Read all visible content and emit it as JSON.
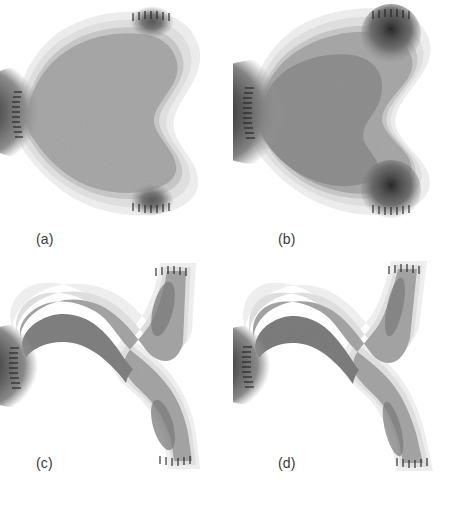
{
  "figure": {
    "type": "contour-field-panels",
    "layout": "2x2 grid",
    "background_color": "#ffffff",
    "width": 466,
    "height": 505,
    "colormap": "grayscale",
    "colormap_direction": "dark = high value, light = low value"
  },
  "levels": {
    "l0_background": "#ffffff",
    "l1_faint": "#f0f0f0",
    "l2_light": "#e2e2e2",
    "l3_midlight": "#c9c9c9",
    "l4_mid": "#a8a8a8",
    "l5_middark": "#8f8f8f",
    "l6_dark": "#6e6e6e",
    "l7_darker": "#4a4a4a",
    "l8_darkest": "#1e1e1e",
    "l9_black": "#000000",
    "tick_color": "#202020",
    "label_color": "#3a3a3a"
  },
  "panels": [
    {
      "id": "a",
      "label": "(a)",
      "description": "Broad bulbous domain with shallow concave indentation on the right side; single hot spot on the left boundary; two small dark blobs at the upper-right and lower-right boundary ends.",
      "topology": "connected",
      "hot_spots": [
        {
          "name": "left-edge-maximum",
          "x": 0.1,
          "y": 0.5,
          "intensity": 1.0
        },
        {
          "name": "upper-right-blob",
          "x": 0.73,
          "y": 0.07,
          "intensity": 0.55
        },
        {
          "name": "lower-right-blob",
          "x": 0.73,
          "y": 0.93,
          "intensity": 0.55
        }
      ],
      "notch_depth": 0.22,
      "halo": true
    },
    {
      "id": "b",
      "label": "(b)",
      "description": "Same family as (a) but with higher contrast: enlarged dark core at the left boundary, deeper right-side concave notch, and strongly developed dark blobs at the upper-right and lower-right ends.",
      "topology": "connected",
      "hot_spots": [
        {
          "name": "left-edge-maximum",
          "x": 0.12,
          "y": 0.5,
          "intensity": 1.0
        },
        {
          "name": "upper-right-blob",
          "x": 0.78,
          "y": 0.08,
          "intensity": 0.8
        },
        {
          "name": "lower-right-blob",
          "x": 0.78,
          "y": 0.92,
          "intensity": 0.8
        }
      ],
      "notch_depth": 0.38,
      "halo": true
    },
    {
      "id": "c",
      "label": "(c)",
      "description": "Narrowed wishbone / Y-shaped domain. A sharp white V-shaped wedge cuts in from the right, nearly severing the body into two curved arms that remain joined at a thin neck.",
      "topology": "necked",
      "hot_spots": [
        {
          "name": "left-edge-maximum",
          "x": 0.1,
          "y": 0.5,
          "intensity": 1.0
        },
        {
          "name": "upper-arm-streak",
          "x": 0.68,
          "y": 0.22,
          "intensity": 0.5
        },
        {
          "name": "lower-arm-streak",
          "x": 0.68,
          "y": 0.78,
          "intensity": 0.5
        }
      ],
      "notch_depth": 0.62,
      "halo": false
    },
    {
      "id": "d",
      "label": "(d)",
      "description": "Fully bifurcated domain: the V-shaped wedge has cut through, leaving two separate curving arms that diverge toward the upper-right and lower-right, joined only near the left trunk.",
      "topology": "bifurcated",
      "hot_spots": [
        {
          "name": "left-edge-maximum",
          "x": 0.11,
          "y": 0.5,
          "intensity": 1.0
        },
        {
          "name": "upper-arm-streak",
          "x": 0.72,
          "y": 0.2,
          "intensity": 0.45
        },
        {
          "name": "lower-arm-streak",
          "x": 0.72,
          "y": 0.8,
          "intensity": 0.45
        }
      ],
      "notch_depth": 0.74,
      "halo": false
    }
  ],
  "boundary_ticks": {
    "name": "boundary-condition-hatch-marks",
    "description": "Short perpendicular tick marks drawn along the left boundary and at the open arm ends of each panel.",
    "count_left_edge": 18,
    "count_arm_end": 9
  }
}
